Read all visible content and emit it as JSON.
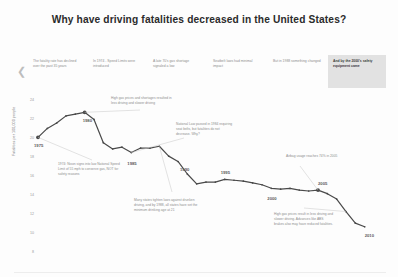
{
  "header": {
    "title": "Why have driving fatalities decreased in the United States?"
  },
  "story": {
    "nav_prev_icon": "chevron-left-icon",
    "cells": [
      {
        "text": "The fatality rate has declined over the past 35 years",
        "active": false
      },
      {
        "text": "In 1974 - Speed Limits were introduced",
        "active": false
      },
      {
        "text": "A late 70's gas shortage signaled a low",
        "active": false
      },
      {
        "text": "Seatbelt laws had minimal impact",
        "active": false
      },
      {
        "text": "But in 1988 something changed",
        "active": false
      },
      {
        "text": "And by the 2000's safety equipment came",
        "active": true
      }
    ]
  },
  "chart_data": {
    "type": "line",
    "title": "Why have driving fatalities decreased in the United States?",
    "xlabel": "",
    "ylabel": "Fatalities per 100,000 people",
    "ylim": [
      8,
      25
    ],
    "xlim": [
      1975,
      2011
    ],
    "grid": false,
    "legend": "none",
    "yticks": [
      24,
      22,
      20,
      18,
      16,
      14,
      12,
      10,
      8
    ],
    "xticks": [
      1975,
      1980,
      1985,
      1990,
      1995,
      2000,
      2005,
      2010
    ],
    "x": [
      1975,
      1976,
      1977,
      1978,
      1979,
      1980,
      1981,
      1982,
      1983,
      1984,
      1985,
      1986,
      1987,
      1988,
      1989,
      1990,
      1991,
      1992,
      1993,
      1994,
      1995,
      1996,
      1997,
      1998,
      1999,
      2000,
      2001,
      2002,
      2003,
      2004,
      2005,
      2006,
      2007,
      2008,
      2009,
      2010
    ],
    "y": [
      20.6,
      21.6,
      22.2,
      23.0,
      23.2,
      23.4,
      22.6,
      20.0,
      19.3,
      19.5,
      18.9,
      19.4,
      19.4,
      19.6,
      18.5,
      17.9,
      16.5,
      15.4,
      15.6,
      15.6,
      15.9,
      15.8,
      15.7,
      15.5,
      15.3,
      14.9,
      14.8,
      14.9,
      14.7,
      14.6,
      14.7,
      14.3,
      13.7,
      12.3,
      11.0,
      10.6
    ],
    "annotations": [
      {
        "id": "annot-high-gas-prices-1980",
        "text": "High gas prices and shortages resulted in less driving and slower driving",
        "bold_lead": "High gas prices and shortages",
        "anchor_year": 1980
      },
      {
        "id": "annot-nixon-speed-limit-1974",
        "text": "1974: Nixon signs into law National Speed Limit of 55 mph to conserve gas, NOT for safety reasons",
        "bold_lead": "55 mph",
        "anchor_year": 1975
      },
      {
        "id": "annot-seatbelt-law-1984",
        "text": "National Law passed in 1984 requiring seat belts, but fatalities do not decrease. Why?",
        "bold_lead": "seat belts",
        "anchor_year": 1985
      },
      {
        "id": "annot-drunken-driving-1988",
        "text": "Many states tighten laws against drunken driving, and by 1988, all states have set the minimum drinking age at 21",
        "bold_lead": "drunken driving",
        "anchor_year": 1988
      },
      {
        "id": "annot-airbag-usage-2005",
        "text": "Airbag usage reaches 74% in 2005",
        "bold_lead": "Airbag usage",
        "anchor_year": 2005
      },
      {
        "id": "annot-gas-prices-abs-2008",
        "text": "High gas prices result in less driving and slower driving. Advances like ABS brakes also may have reduced fatalities.",
        "bold_lead": "ABS",
        "anchor_year": 2008
      }
    ]
  },
  "axis": {
    "y_title": "Fatalities per 100,000 people",
    "y_ticks": [
      "24",
      "22",
      "20",
      "18",
      "16",
      "14",
      "12",
      "10",
      "8"
    ],
    "x_labels": [
      "1975",
      "1980",
      "1985",
      "1990",
      "1995",
      "2000",
      "2005",
      "2010"
    ]
  },
  "colors": {
    "line": "#4a4a4a",
    "highlight_bg": "#e2e2e2",
    "text": "#3c3c3c",
    "muted": "#8d8d8d"
  }
}
